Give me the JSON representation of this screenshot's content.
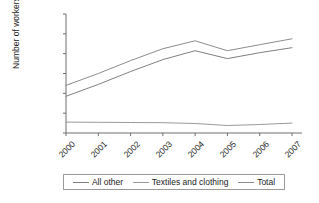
{
  "chart_data": {
    "type": "line",
    "title": "",
    "xlabel": "",
    "ylabel": "Number of workers",
    "categories": [
      "2000",
      "2001",
      "2002",
      "2003",
      "2004",
      "2005",
      "2006",
      "2007"
    ],
    "ylim": [
      0,
      60000
    ],
    "yticks": [
      "0",
      "10,000",
      "20,000",
      "30,000",
      "40,000",
      "50,000",
      "60,000"
    ],
    "ytick_values": [
      0,
      10000,
      20000,
      30000,
      40000,
      50000,
      60000
    ],
    "grid": false,
    "legend_position": "bottom",
    "series": [
      {
        "name": "All other",
        "color": "#808080",
        "values": [
          18500,
          24500,
          31000,
          37000,
          41500,
          37500,
          40500,
          43000
        ]
      },
      {
        "name": "Textiles and clothing",
        "color": "#9a9a9a",
        "values": [
          5500,
          5400,
          5300,
          5200,
          4800,
          3800,
          4300,
          5000
        ]
      },
      {
        "name": "Total",
        "color": "#8c8c8c",
        "values": [
          24000,
          30000,
          36500,
          42500,
          46500,
          41500,
          44500,
          47500
        ]
      }
    ]
  },
  "legend": {
    "items": [
      {
        "label": "All other"
      },
      {
        "label": "Textiles and clothing"
      },
      {
        "label": "Total"
      }
    ]
  }
}
